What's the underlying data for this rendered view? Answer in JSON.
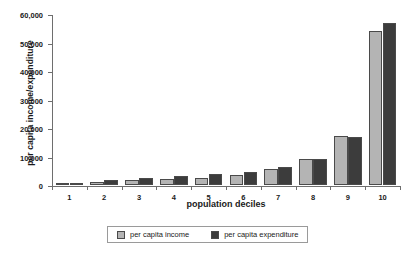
{
  "chart_data": {
    "type": "bar",
    "title": "",
    "xlabel": "population deciles",
    "ylabel": "per capita income/expenditure",
    "categories": [
      "1",
      "2",
      "3",
      "4",
      "5",
      "6",
      "7",
      "8",
      "9",
      "10"
    ],
    "series": [
      {
        "name": "per capita income",
        "color": "#b4b4b4",
        "values": [
          600,
          1200,
          1700,
          2000,
          2500,
          3600,
          5500,
          9000,
          17200,
          54000
        ]
      },
      {
        "name": "per capita expenditure",
        "color": "#3c3c3c",
        "values": [
          700,
          1700,
          2400,
          3000,
          3800,
          4600,
          6200,
          9300,
          16800,
          57000
        ]
      }
    ],
    "ylim": [
      0,
      60000
    ],
    "ytick_values": [
      0,
      10000,
      20000,
      30000,
      40000,
      50000,
      60000
    ],
    "ytick_labels": [
      "0",
      "10,000",
      "20,000",
      "30,000",
      "40,000",
      "50,000",
      "60,000"
    ],
    "grid": false,
    "legend_position": "bottom-center"
  },
  "legend": {
    "entries": [
      {
        "label": "per capita income"
      },
      {
        "label": "per capita expenditure"
      }
    ]
  },
  "colors": {
    "income": "#b4b4b4",
    "expenditure": "#3c3c3c",
    "axis": "#6e6e6e",
    "text": "#1a1a1a",
    "background": "#ffffff"
  }
}
